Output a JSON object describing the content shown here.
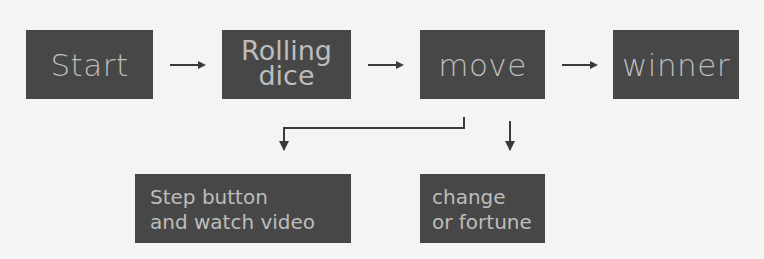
{
  "diagram": {
    "type": "flowchart",
    "colors": {
      "box_fill": "#474747",
      "box_text": "#bdbdbd",
      "arrow": "#3a3a3a",
      "background": "#f4f4f2"
    },
    "nodes": [
      {
        "id": "start",
        "label": "Start",
        "lines": [
          "Start"
        ]
      },
      {
        "id": "rolling_dice",
        "label": "Rolling dice",
        "lines": [
          "Rolling",
          "dice"
        ]
      },
      {
        "id": "move",
        "label": "move",
        "lines": [
          "move"
        ]
      },
      {
        "id": "winner",
        "label": "winner",
        "lines": [
          "winner"
        ]
      },
      {
        "id": "step_button",
        "label": "Step button and watch video",
        "lines": [
          "Step button",
          "and watch video"
        ]
      },
      {
        "id": "change_fortune",
        "label": "change or fortune",
        "lines": [
          "change",
          "or fortune"
        ]
      }
    ],
    "edges": [
      {
        "from": "start",
        "to": "rolling_dice"
      },
      {
        "from": "rolling_dice",
        "to": "move"
      },
      {
        "from": "move",
        "to": "winner"
      },
      {
        "from": "move",
        "to": "step_button"
      },
      {
        "from": "move",
        "to": "change_fortune"
      }
    ]
  }
}
